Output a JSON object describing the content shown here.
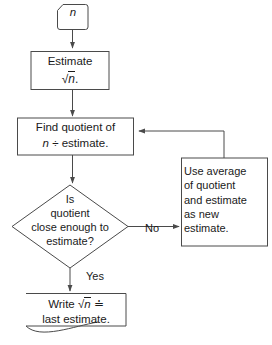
{
  "diagram": {
    "type": "flowchart",
    "orientation": "top-to-bottom with feedback loop",
    "colors": {
      "stroke": "#4a4a4a",
      "text": "#1a1a1a",
      "background": "#ffffff"
    },
    "nodes": {
      "start": {
        "shape": "terminator-clipped-corner",
        "label": "n"
      },
      "estimate": {
        "shape": "rectangle",
        "line1": "Estimate",
        "line2_prefix": "",
        "line2_radical": "n",
        "line2_suffix": "."
      },
      "find_quotient": {
        "shape": "rectangle",
        "line1": "Find quotient of",
        "line2_var": "n",
        "line2_rest": " ÷ estimate."
      },
      "decision": {
        "shape": "diamond",
        "text": "Is\nquotient\nclose enough to\nestimate?"
      },
      "use_average": {
        "shape": "rectangle",
        "text": "Use average\nof quotient\nand estimate\nas new\nestimate."
      },
      "write_result": {
        "shape": "document-wavy-bottom",
        "line1_prefix": "Write ",
        "line1_radical": "n",
        "line1_suffix": " ≐",
        "line2": "last estimate."
      }
    },
    "edge_labels": {
      "no": "No",
      "yes": "Yes"
    }
  }
}
